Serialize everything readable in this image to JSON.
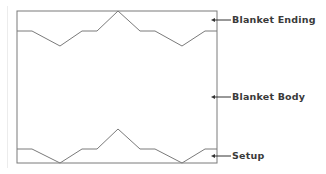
{
  "diagram": {
    "title": "",
    "labels": {
      "ending": "Blanket Ending",
      "body": "Blanket Body",
      "setup": "Setup"
    },
    "colors": {
      "line": "#7a7a7a",
      "text": "#3a3a3a",
      "background": "#ffffff"
    },
    "regions": [
      {
        "name": "Blanket Ending",
        "position": "top zigzag edge"
      },
      {
        "name": "Blanket Body",
        "position": "middle rectangle"
      },
      {
        "name": "Setup",
        "position": "bottom zigzag edge"
      }
    ]
  }
}
